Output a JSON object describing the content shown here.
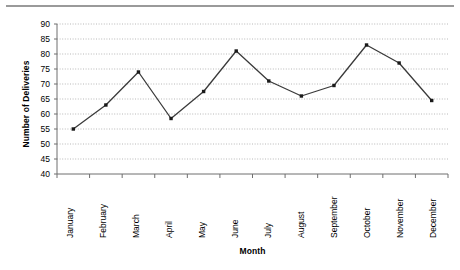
{
  "chart_data": {
    "type": "line",
    "title": "",
    "xlabel": "Month",
    "ylabel": "Number of Deliveries",
    "categories": [
      "January",
      "February",
      "March",
      "April",
      "May",
      "June",
      "July",
      "August",
      "September",
      "October",
      "November",
      "December"
    ],
    "values": [
      55,
      63,
      74,
      58.5,
      67.5,
      81,
      71,
      66,
      69.5,
      83,
      77,
      64.5
    ],
    "series": [
      {
        "name": "Number of Deliveries",
        "values": [
          55,
          63,
          74,
          58.5,
          67.5,
          81,
          71,
          66,
          69.5,
          83,
          77,
          64.5
        ]
      }
    ],
    "ylim": [
      40,
      90
    ],
    "ytick_step": 5,
    "ytick_labels": [
      "90",
      "85",
      "80",
      "75",
      "70",
      "65",
      "60",
      "55",
      "50",
      "45",
      "40"
    ],
    "ytick_values": [
      90,
      85,
      80,
      75,
      70,
      65,
      60,
      55,
      50,
      45,
      40
    ],
    "grid": true,
    "grid_style": "dotted-horizontal",
    "legend": "none",
    "marker": "square",
    "colors": {
      "line": "#3a3a3a",
      "marker": "#1a1a1a",
      "grid": "#b8b8b8",
      "axis": "#6e6e6e",
      "rule": "#9a9a9a",
      "background": "#ffffff",
      "text": "#000000"
    }
  }
}
